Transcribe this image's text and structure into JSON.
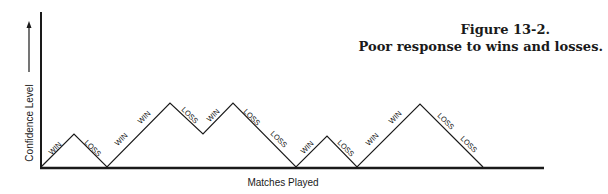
{
  "figure": {
    "title": "Figure 13-2.",
    "subtitle": "Poor response to wins and losses."
  },
  "chart_data": {
    "type": "line",
    "title": "Figure 13-2. Poor response to wins and losses.",
    "xlabel": "Matches Played",
    "ylabel": "Confidence Level",
    "grid": false,
    "legend": null,
    "sequence": [
      "WIN",
      "LOSS",
      "WIN",
      "WIN",
      "LOSS",
      "WIN",
      "LOSS",
      "LOSS",
      "WIN",
      "LOSS",
      "WIN",
      "WIN",
      "LOSS",
      "LOSS"
    ],
    "x": [
      0,
      1,
      2,
      3,
      4,
      5,
      6,
      7,
      8,
      9,
      10,
      11,
      12,
      13,
      14
    ],
    "values": [
      0,
      1,
      0,
      1,
      2,
      1,
      2,
      1,
      0,
      1,
      0,
      1,
      2,
      1,
      0
    ],
    "points_px": [
      [
        41,
        167
      ],
      [
        74,
        134
      ],
      [
        107,
        167
      ],
      [
        170,
        103
      ],
      [
        203,
        134
      ],
      [
        233,
        103
      ],
      [
        296,
        167
      ],
      [
        327,
        136
      ],
      [
        357,
        167
      ],
      [
        420,
        104
      ],
      [
        483,
        167
      ]
    ],
    "segment_labels": [
      {
        "label": "WIN",
        "x": 57,
        "y": 150,
        "angle": -45
      },
      {
        "label": "LOSS",
        "x": 91,
        "y": 150,
        "angle": 45
      },
      {
        "label": "WIN",
        "x": 123,
        "y": 141,
        "angle": -45
      },
      {
        "label": "WIN",
        "x": 146,
        "y": 119,
        "angle": -45
      },
      {
        "label": "LOSS",
        "x": 188,
        "y": 117,
        "angle": 45
      },
      {
        "label": "WIN",
        "x": 215,
        "y": 117,
        "angle": -45
      },
      {
        "label": "LOSS",
        "x": 250,
        "y": 119,
        "angle": 45
      },
      {
        "label": "LOSS",
        "x": 277,
        "y": 141,
        "angle": 45
      },
      {
        "label": "WIN",
        "x": 309,
        "y": 149,
        "angle": -45
      },
      {
        "label": "LOSS",
        "x": 344,
        "y": 150,
        "angle": 45
      },
      {
        "label": "WIN",
        "x": 374,
        "y": 141,
        "angle": -45
      },
      {
        "label": "WIN",
        "x": 397,
        "y": 119,
        "angle": -45
      },
      {
        "label": "LOSS",
        "x": 444,
        "y": 123,
        "angle": 45
      },
      {
        "label": "LOSS",
        "x": 467,
        "y": 146,
        "angle": 45
      }
    ],
    "axis": {
      "origin": [
        41,
        168
      ],
      "y_top": 12,
      "x_end": 544
    }
  }
}
